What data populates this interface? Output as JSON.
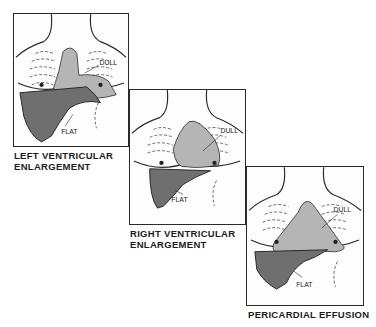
{
  "figure": {
    "panels": [
      {
        "id": "left-ventricular-enlargement",
        "caption_lines": [
          "LEFT VENTRICULAR",
          "ENLARGEMENT"
        ],
        "labels": {
          "dull": "DULL",
          "flat": "FLAT"
        }
      },
      {
        "id": "right-ventricular-enlargement",
        "caption_lines": [
          "RIGHT VENTRICULAR",
          "ENLARGEMENT"
        ],
        "labels": {
          "dull": "DULL",
          "flat": "FLAT"
        }
      },
      {
        "id": "pericardial-effusion",
        "caption_lines": [
          "PERICARDIAL EFFUSION"
        ],
        "labels": {
          "dull": "DULL",
          "flat": "FLAT"
        }
      }
    ],
    "colors": {
      "dull_region": "#b5b5b5",
      "flat_region": "#6f6f6f",
      "outline": "#2a2a2a"
    }
  }
}
